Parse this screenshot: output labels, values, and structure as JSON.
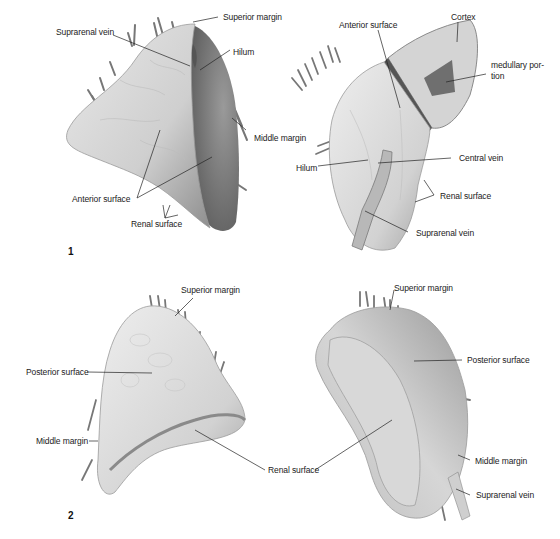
{
  "figure_1": {
    "number": "1",
    "left_view": {
      "labels": {
        "superior_margin": "Superior margin",
        "suprarenal_vein": "Suprarenal vein",
        "hilum": "Hilum",
        "middle_margin": "Middle margin",
        "anterior_surface": "Anterior surface",
        "renal_surface": "Renal surface"
      }
    },
    "right_view": {
      "labels": {
        "anterior_surface": "Anterior surface",
        "cortex": "Cortex",
        "medullary_portion_line1": "medullary por-",
        "medullary_portion_line2": "tion",
        "hilum": "Hilum",
        "central_vein": "Central vein",
        "renal_surface": "Renal surface",
        "suprarenal_vein": "Suprarenal vein"
      }
    }
  },
  "figure_2": {
    "number": "2",
    "left_view": {
      "labels": {
        "superior_margin": "Superior margin",
        "posterior_surface": "Posterior surface",
        "middle_margin": "Middle margin",
        "renal_surface": "Renal surface"
      }
    },
    "right_view": {
      "labels": {
        "superior_margin": "Superior margin",
        "posterior_surface": "Posterior surface",
        "middle_margin": "Middle margin",
        "suprarenal_vein": "Suprarenal vein"
      }
    }
  },
  "colors": {
    "organ_fill": "#d9d9d9",
    "organ_shadow": "#8a8a8a",
    "leader_line": "#222222",
    "cortex_fill": "#cfcfcf",
    "medulla_fill": "#6e6e6e"
  }
}
